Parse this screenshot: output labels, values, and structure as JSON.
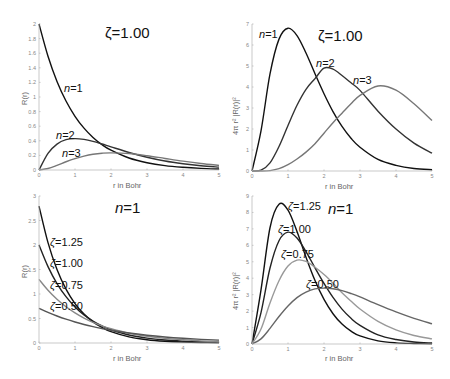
{
  "chart_data": [
    {
      "type": "line",
      "title": "ζ=1.00",
      "xlabel": "r in Bohr",
      "ylabel": "R(r)",
      "xlim": [
        0,
        5
      ],
      "ylim": [
        0,
        2
      ],
      "xticks": [
        "0",
        "1",
        "2",
        "3",
        "4",
        "5"
      ],
      "yticks": [
        "0",
        "0.2",
        "0.4",
        "0.6",
        "0.8",
        "1",
        "1.2",
        "1.4",
        "1.6",
        "1.8",
        "2"
      ],
      "grid": false,
      "x": [
        0,
        0.25,
        0.5,
        0.75,
        1,
        1.25,
        1.5,
        1.75,
        2,
        2.5,
        3,
        3.5,
        4,
        4.5,
        5
      ],
      "series": [
        {
          "name": "n=1",
          "label": "n=1",
          "color": "#111111",
          "values": [
            2.0,
            1.558,
            1.213,
            0.945,
            0.736,
            0.573,
            0.446,
            0.347,
            0.271,
            0.164,
            0.1,
            0.06,
            0.037,
            0.022,
            0.013
          ]
        },
        {
          "name": "n=2",
          "label": "n=2",
          "color": "#333333",
          "values": [
            0,
            0.228,
            0.355,
            0.415,
            0.43,
            0.419,
            0.392,
            0.356,
            0.317,
            0.24,
            0.175,
            0.123,
            0.086,
            0.058,
            0.039
          ]
        },
        {
          "name": "n=3",
          "label": "n=3",
          "color": "#777777",
          "values": [
            0,
            0.021,
            0.064,
            0.113,
            0.156,
            0.19,
            0.215,
            0.23,
            0.235,
            0.226,
            0.196,
            0.158,
            0.121,
            0.089,
            0.064
          ]
        }
      ],
      "annotations": [
        {
          "text": "n=1",
          "x": 1.45,
          "y": 0.95
        },
        {
          "text": "n=2",
          "x": 0.5,
          "y": 0.48
        },
        {
          "text": "n=3",
          "x": 0.6,
          "y": 0.25
        }
      ]
    },
    {
      "type": "line",
      "title": "ζ=1.00",
      "xlabel": "r in Bohr",
      "ylabel": "4π r² |R(r)|²",
      "xlim": [
        0,
        5
      ],
      "ylim": [
        0,
        7
      ],
      "xticks": [
        "0",
        "1",
        "2",
        "3",
        "4",
        "5"
      ],
      "yticks": [
        "0",
        "1",
        "2",
        "3",
        "4",
        "5",
        "6",
        "7"
      ],
      "grid": false,
      "x": [
        0,
        0.25,
        0.5,
        0.75,
        1,
        1.25,
        1.5,
        1.75,
        2,
        2.25,
        2.5,
        2.75,
        3,
        3.5,
        4,
        4.5,
        5
      ],
      "series": [
        {
          "name": "n=1",
          "label": "n=1",
          "color": "#111111",
          "values": [
            0,
            1.91,
            4.62,
            6.28,
            6.8,
            6.45,
            5.62,
            4.63,
            3.68,
            2.83,
            2.12,
            1.56,
            1.13,
            0.55,
            0.27,
            0.12,
            0.06
          ]
        },
        {
          "name": "n=2",
          "label": "n=2",
          "color": "#333333",
          "values": [
            0,
            0.04,
            0.39,
            1.17,
            2.17,
            3.13,
            3.89,
            4.4,
            4.9,
            4.85,
            4.55,
            4.2,
            3.84,
            2.85,
            2.0,
            1.33,
            0.85
          ]
        },
        {
          "name": "n=3",
          "label": "n=3",
          "color": "#777777",
          "values": [
            0,
            0.0,
            0.02,
            0.11,
            0.3,
            0.57,
            0.9,
            1.3,
            1.8,
            2.3,
            2.75,
            3.2,
            3.6,
            4.05,
            3.85,
            3.2,
            2.4,
            1.6
          ]
        }
      ],
      "annotations": [
        {
          "text": "n=1",
          "x": 0.2,
          "y": 6.7
        },
        {
          "text": "n=2",
          "x": 1.8,
          "y": 5.0
        },
        {
          "text": "n=3",
          "x": 2.85,
          "y": 4.2
        }
      ]
    },
    {
      "type": "line",
      "title": "n=1",
      "xlabel": "r in Bohr",
      "ylabel": "R(r)",
      "xlim": [
        0,
        5
      ],
      "ylim": [
        0,
        3
      ],
      "xticks": [
        "0",
        "1",
        "2",
        "3",
        "4",
        "5"
      ],
      "yticks": [
        "0",
        "0.5",
        "1",
        "1.5",
        "2",
        "2.5",
        "3"
      ],
      "grid": false,
      "x": [
        0,
        0.25,
        0.5,
        0.75,
        1,
        1.25,
        1.5,
        1.75,
        2,
        2.5,
        3,
        3.5,
        4,
        4.5,
        5
      ],
      "series": [
        {
          "name": "ζ=1.25",
          "label": "ζ=1.25",
          "color": "#111111",
          "values": [
            2.795,
            2.048,
            1.5,
            1.099,
            0.805,
            0.59,
            0.432,
            0.317,
            0.232,
            0.124,
            0.066,
            0.035,
            0.019,
            0.01,
            0.005
          ]
        },
        {
          "name": "ζ=1.00",
          "label": "ζ=1.00",
          "color": "#222222",
          "values": [
            2.0,
            1.558,
            1.213,
            0.945,
            0.736,
            0.573,
            0.446,
            0.347,
            0.271,
            0.164,
            0.1,
            0.06,
            0.037,
            0.022,
            0.013
          ]
        },
        {
          "name": "ζ=0.75",
          "label": "ζ=0.75",
          "color": "#888888",
          "values": [
            1.299,
            1.076,
            0.892,
            0.739,
            0.614,
            0.508,
            0.421,
            0.349,
            0.29,
            0.199,
            0.137,
            0.094,
            0.065,
            0.044,
            0.031
          ]
        },
        {
          "name": "ζ=0.50",
          "label": "ζ=0.50",
          "color": "#555555",
          "values": [
            0.707,
            0.624,
            0.551,
            0.486,
            0.429,
            0.378,
            0.334,
            0.295,
            0.26,
            0.203,
            0.158,
            0.123,
            0.096,
            0.075,
            0.058
          ]
        }
      ],
      "annotations": [
        {
          "text": "ζ=1.25",
          "x": 0.35,
          "y": 2.05
        },
        {
          "text": "ζ=1.00",
          "x": 0.3,
          "y": 1.6
        },
        {
          "text": "ζ=0.75",
          "x": 0.3,
          "y": 1.15
        },
        {
          "text": "ζ=0.50",
          "x": 0.3,
          "y": 0.7
        }
      ]
    },
    {
      "type": "line",
      "title": "n=1",
      "xlabel": "r in Bohr",
      "ylabel": "4π r² |R(r)|²",
      "xlim": [
        0,
        5
      ],
      "ylim": [
        0,
        9
      ],
      "xticks": [
        "0",
        "1",
        "2",
        "3",
        "4",
        "5"
      ],
      "yticks": [
        "0",
        "1",
        "2",
        "3",
        "4",
        "5",
        "6",
        "7",
        "8",
        "9"
      ],
      "grid": false,
      "x": [
        0,
        0.25,
        0.5,
        0.75,
        1,
        1.25,
        1.5,
        1.75,
        2,
        2.25,
        2.5,
        2.75,
        3,
        3.5,
        4,
        4.5,
        5
      ],
      "series": [
        {
          "name": "ζ=1.25",
          "label": "ζ=1.25",
          "color": "#111111",
          "values": [
            0,
            3.29,
            7.07,
            8.5,
            8.14,
            6.84,
            5.28,
            3.86,
            2.71,
            1.84,
            1.21,
            0.78,
            0.49,
            0.19,
            0.07,
            0.03,
            0.01
          ]
        },
        {
          "name": "ζ=1.00",
          "label": "ζ=1.00",
          "color": "#222222",
          "values": [
            0,
            1.91,
            4.62,
            6.28,
            6.8,
            6.45,
            5.62,
            4.63,
            3.68,
            2.83,
            2.12,
            1.56,
            1.13,
            0.55,
            0.27,
            0.12,
            0.06
          ]
        },
        {
          "name": "ζ=0.75",
          "label": "ζ=0.75",
          "color": "#999999",
          "values": [
            0,
            0.91,
            2.5,
            3.85,
            4.74,
            5.1,
            5.02,
            4.67,
            4.23,
            3.7,
            3.12,
            2.61,
            2.13,
            1.38,
            0.86,
            0.52,
            0.31
          ]
        },
        {
          "name": "ζ=0.50",
          "label": "ζ=0.50",
          "color": "#666666",
          "values": [
            0,
            0.31,
            0.95,
            1.67,
            2.31,
            2.82,
            3.15,
            3.35,
            3.4,
            3.36,
            3.25,
            3.07,
            2.86,
            2.39,
            1.95,
            1.56,
            1.23
          ]
        }
      ],
      "annotations": [
        {
          "text": "ζ=1.25",
          "x": 1.05,
          "y": 8.6
        },
        {
          "text": "ζ=1.00",
          "x": 0.75,
          "y": 7.0
        },
        {
          "text": "ζ=0.75",
          "x": 0.85,
          "y": 5.3
        },
        {
          "text": "ζ=0.50",
          "x": 1.55,
          "y": 3.5
        }
      ]
    }
  ],
  "panels": [
    {
      "title": "ζ=1.00",
      "xlabel": "r in Bohr",
      "ylabel": "R(r)"
    },
    {
      "title": "ζ=1.00",
      "xlabel": "r in Bohr",
      "ylabel": "4π r² |R(r)|²"
    },
    {
      "title": "n=1",
      "xlabel": "r in Bohr",
      "ylabel": "R(r)"
    },
    {
      "title": "n=1",
      "xlabel": "r in Bohr",
      "ylabel": "4π r² |R(r)|²"
    }
  ]
}
